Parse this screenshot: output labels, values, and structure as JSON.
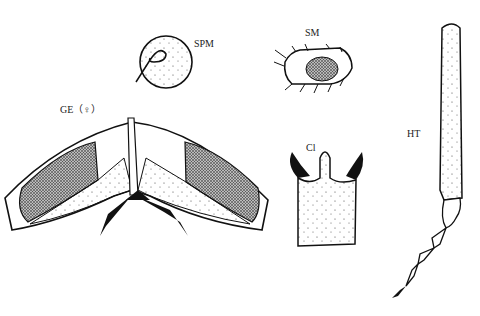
{
  "figure": {
    "labels": {
      "spermatheca": "SPM",
      "sensory_mark": "SM",
      "genitalia": "GE（♀）",
      "claw": "Cl",
      "hind_tarsus": "HT"
    }
  }
}
